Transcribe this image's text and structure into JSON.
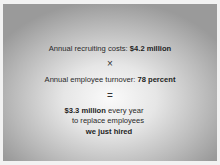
{
  "slide": {
    "line1": {
      "text": "Annual recruiting costs: ",
      "bold": "$4.2 million"
    },
    "operator1": "×",
    "line2": {
      "text": "Annual employee turnover: ",
      "bold": "78 percent"
    },
    "operator2": "=",
    "result": {
      "bold": "$3.3 million",
      "text": " every year",
      "line2": "to replace employees",
      "line3_bold": "we just hired"
    }
  }
}
